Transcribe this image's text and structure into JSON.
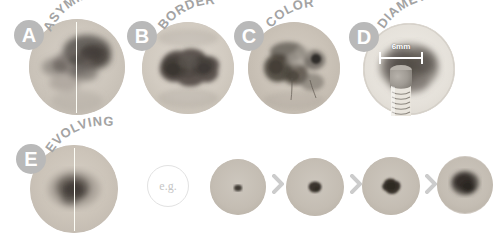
{
  "figure": {
    "background_color": "#ffffff",
    "badge_color": "#b9b9b9",
    "badge_text_color": "#ffffff",
    "caption_color": "#a3a3a3",
    "chevron_color": "#cccccc"
  },
  "panels": [
    {
      "id": "asymmetry",
      "letter": "A",
      "label": "ASYMMETRY",
      "has_split_line": true,
      "lesion_name": "asymmetric-mole-photo"
    },
    {
      "id": "border",
      "letter": "B",
      "label": "BORDER",
      "has_split_line": false,
      "lesion_name": "irregular-border-mole-photo"
    },
    {
      "id": "color",
      "letter": "C",
      "label": "COLOR",
      "has_split_line": false,
      "lesion_name": "multicolor-mole-photo"
    },
    {
      "id": "diameter",
      "letter": "D",
      "label": "DIAMETER",
      "has_split_line": false,
      "lesion_name": "large-diameter-mole-photo",
      "measure_label": "6mm",
      "has_pencil": true
    },
    {
      "id": "evolving",
      "letter": "E",
      "label": "EVOLVING",
      "has_split_line": true,
      "lesion_name": "evolving-mole-photo"
    }
  ],
  "evolving_sequence": {
    "example_label": "e.g.",
    "separator": "›",
    "steps": [
      {
        "stage": 1,
        "lesion_name": "evolving-stage-1-photo"
      },
      {
        "stage": 2,
        "lesion_name": "evolving-stage-2-photo"
      },
      {
        "stage": 3,
        "lesion_name": "evolving-stage-3-photo"
      },
      {
        "stage": 4,
        "lesion_name": "evolving-stage-4-photo"
      }
    ]
  }
}
